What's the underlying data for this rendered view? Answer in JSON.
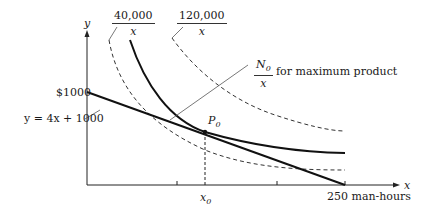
{
  "axes": {
    "x_label": "x",
    "y_label": "y",
    "y_intercept_label": "$1000",
    "x_end_label": "250 man-hours",
    "x0_label": "x",
    "x0_sub": "0"
  },
  "curves": {
    "low": {
      "numerator": "40,000",
      "denominator": "x",
      "style": "dashed"
    },
    "high": {
      "numerator": "120,000",
      "denominator": "x",
      "style": "dashed"
    },
    "optimal": {
      "numerator": "N",
      "numerator_sub": "0",
      "denominator": "x",
      "note": "for maximum product",
      "style": "solid"
    }
  },
  "line": {
    "equation": "y = 4x + 1000"
  },
  "point": {
    "label": "P",
    "sub": "0"
  },
  "colors": {
    "ink": "#1a1a1a",
    "background": "#ffffff"
  }
}
